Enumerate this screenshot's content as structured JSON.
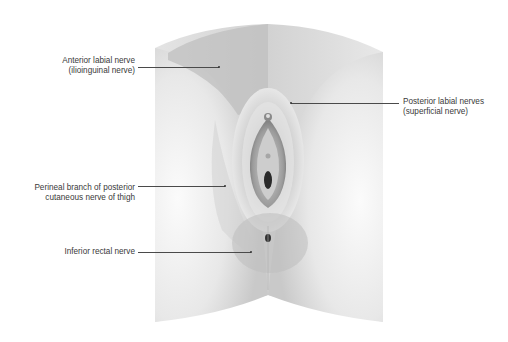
{
  "diagram": {
    "type": "anatomical illustration",
    "labels": [
      {
        "id": "anterior-labial",
        "line1": "Anterior labial nerve",
        "line2": "(ilioinguinal nerve)"
      },
      {
        "id": "posterior-labial",
        "line1": "Posterior labial nerves",
        "line2": "(superficial nerve)"
      },
      {
        "id": "perineal-branch",
        "line1": "Perineal branch of posterior",
        "line2": "cutaneous nerve of thigh"
      },
      {
        "id": "inferior-rectal",
        "line1": "Inferior rectal nerve",
        "line2": ""
      }
    ],
    "colors": {
      "background": "#ffffff",
      "skin_light": "#f2f2f2",
      "skin_mid": "#d9d9d9",
      "region_shade": "#c8c8c8",
      "text": "#3a3a3a",
      "leader_line": "#4a4a4a"
    }
  }
}
